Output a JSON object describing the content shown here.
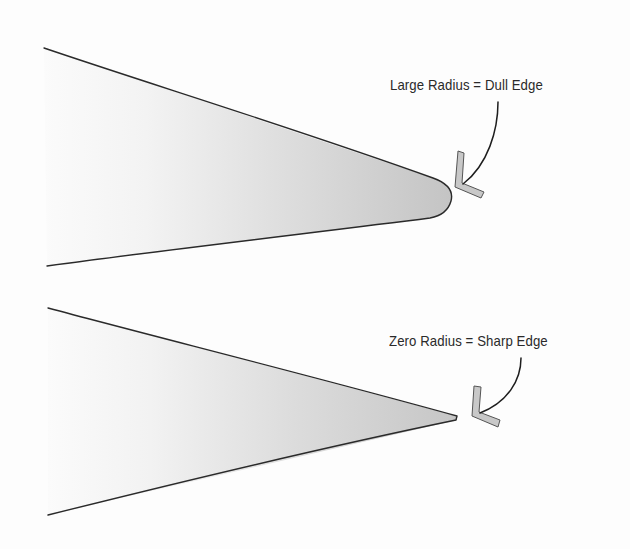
{
  "diagram": {
    "title": "",
    "panels": [
      {
        "id": "dull",
        "label": "Large Radius = Dull Edge",
        "tip_shape": "rounded",
        "pointer_icon": "chevron-marker"
      },
      {
        "id": "sharp",
        "label": "Zero Radius = Sharp Edge",
        "tip_shape": "pointed",
        "pointer_icon": "chevron-marker"
      }
    ],
    "colors": {
      "background": "#fdfdfd",
      "outline": "#2a2a2a",
      "fill_light": "#f6f6f6",
      "fill_dark": "#c9c9c9",
      "marker_fill": "#c8c8c8"
    }
  }
}
